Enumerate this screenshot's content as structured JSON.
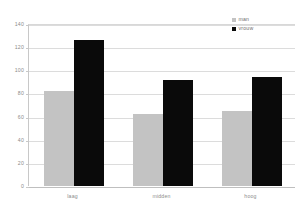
{
  "chart_data": {
    "type": "bar",
    "title": "",
    "subtitle": "",
    "xlabel": "",
    "ylabel": "",
    "categories": [
      "laag",
      "midden",
      "hoog"
    ],
    "series": [
      {
        "name": "man",
        "color": "#c3c3c3",
        "values": [
          82,
          62,
          65
        ]
      },
      {
        "name": "vrouw",
        "color": "#0a0a0a",
        "values": [
          126,
          92,
          94
        ]
      }
    ],
    "ylim": [
      0,
      140
    ],
    "yticks": [
      0,
      20,
      40,
      60,
      80,
      100,
      120,
      140
    ],
    "ytick_labels": [
      "0",
      "20",
      "40",
      "60",
      "80",
      "100",
      "120",
      "140"
    ],
    "grid": true,
    "grid_axis": "y",
    "legend_position": "top-right",
    "background_color": "#ffffff",
    "grid_color": "#dcdcdc",
    "axis_color": "#c8c8c8",
    "tick_text_color": "#8c8c8c"
  },
  "legend": {
    "entries": [
      {
        "label": "man",
        "swatch": "legend-swatch-man"
      },
      {
        "label": "vrouw",
        "swatch": "legend-swatch-vrouw"
      }
    ]
  }
}
